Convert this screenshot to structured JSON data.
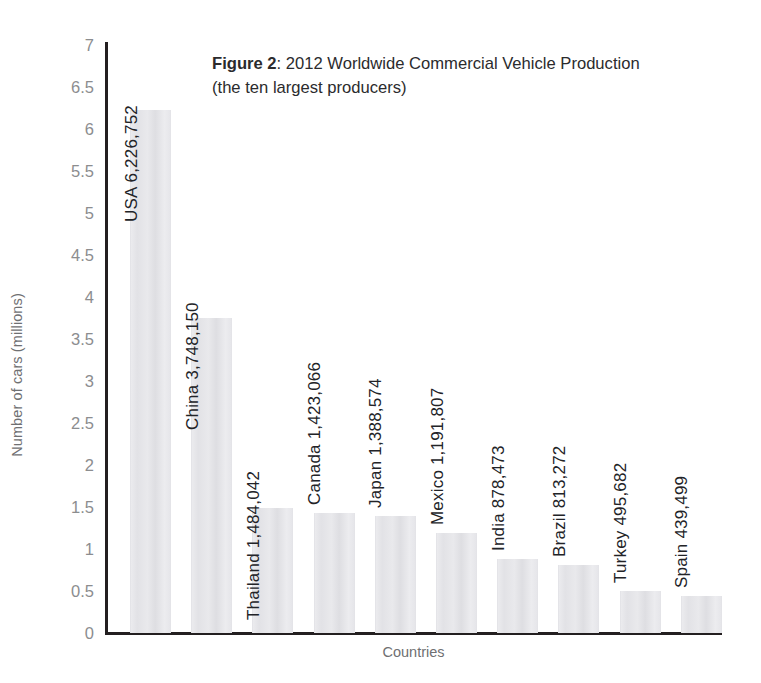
{
  "chart_data": {
    "type": "bar",
    "title": "Figure 2: 2012 Worldwide Commercial Vehicle Production (the ten largest producers)",
    "title_label": "Figure 2",
    "title_separator": ": ",
    "title_line1": "2012 Worldwide Commercial Vehicle Production",
    "title_line2": "(the ten largest producers)",
    "xlabel": "Countries",
    "ylabel": "Number of cars (millions)",
    "ylim": [
      0,
      7
    ],
    "ytick_step": 0.5,
    "ytick_labels": [
      "7",
      "6.5",
      "6",
      "5.5",
      "5",
      "4.5",
      "4",
      "3.5",
      "3",
      "2.5",
      "2",
      "1.5",
      "1",
      "0.5",
      "0"
    ],
    "grid": false,
    "legend": "none",
    "bar_color": "#e6e6ea",
    "axis_color": "#231f20",
    "categories": [
      "USA",
      "China",
      "Thailand",
      "Canada",
      "Japan",
      "Mexico",
      "India",
      "Brazil",
      "Turkey",
      "Spain"
    ],
    "values": [
      6226752,
      3748150,
      1484042,
      1423066,
      1388574,
      1191807,
      878473,
      813272,
      495682,
      439499
    ],
    "values_millions": [
      6.226752,
      3.74815,
      1.484042,
      1.423066,
      1.388574,
      1.191807,
      0.878473,
      0.813272,
      0.495682,
      0.439499
    ],
    "value_labels": [
      "6,226,752",
      "3,748,150",
      "1,484,042",
      "1,423,066",
      "1,388,574",
      "1,191,807",
      "878,473",
      "813,272",
      "495,682",
      "439,499"
    ],
    "bars": [
      {
        "category": "USA",
        "value": 6226752,
        "value_label": "6,226,752",
        "label": "USA 6,226,752"
      },
      {
        "category": "China",
        "value": 3748150,
        "value_label": "3,748,150",
        "label": "China 3,748,150"
      },
      {
        "category": "Thailand",
        "value": 1484042,
        "value_label": "1,484,042",
        "label": "Thailand 1,484,042"
      },
      {
        "category": "Canada",
        "value": 1423066,
        "value_label": "1,423,066",
        "label": "Canada 1,423,066"
      },
      {
        "category": "Japan",
        "value": 1388574,
        "value_label": "1,388,574",
        "label": "Japan 1,388,574"
      },
      {
        "category": "Mexico",
        "value": 1191807,
        "value_label": "1,191,807",
        "label": "Mexico 1,191,807"
      },
      {
        "category": "India",
        "value": 878473,
        "value_label": "878,473",
        "label": "India 878,473"
      },
      {
        "category": "Brazil",
        "value": 813272,
        "value_label": "813,272",
        "label": "Brazil 813,272"
      },
      {
        "category": "Turkey",
        "value": 495682,
        "value_label": "495,682",
        "label": "Turkey 495,682"
      },
      {
        "category": "Spain",
        "value": 439499,
        "value_label": "439,499",
        "label": "Spain 439,499"
      }
    ]
  }
}
